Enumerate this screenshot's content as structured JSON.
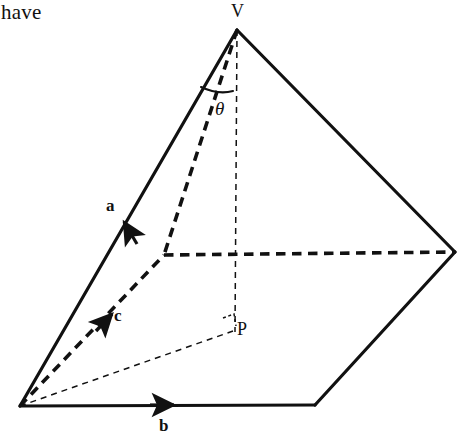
{
  "page": {
    "width": 462,
    "height": 434,
    "background_color": "#ffffff",
    "ink_color": "#111111"
  },
  "body_text": {
    "fragment": "have",
    "x": 2,
    "y": 4
  },
  "figure": {
    "type": "geometric-diagram",
    "stroke_color": "#111111",
    "vertices": [
      {
        "name": "V",
        "role": "apex",
        "x": 237,
        "y": 30
      },
      {
        "name": "A",
        "role": "base-front-left",
        "x": 20,
        "y": 406
      },
      {
        "name": "B",
        "role": "base-front-right",
        "x": 315,
        "y": 405
      },
      {
        "name": "D",
        "role": "base-right",
        "x": 455,
        "y": 252
      },
      {
        "name": "C",
        "role": "base-back-hidden",
        "x": 164,
        "y": 255
      },
      {
        "name": "P",
        "role": "foot-of-perpendicular",
        "x": 235,
        "y": 330
      }
    ],
    "edges": [
      {
        "name": "edge-V-A",
        "style": "solid",
        "width": 3.2,
        "from": [
          237,
          30
        ],
        "to": [
          20,
          406
        ]
      },
      {
        "name": "edge-V-D",
        "style": "solid",
        "width": 3.2,
        "from": [
          237,
          30
        ],
        "to": [
          455,
          252
        ]
      },
      {
        "name": "edge-A-B",
        "style": "solid",
        "width": 3.2,
        "from": [
          20,
          406
        ],
        "to": [
          315,
          405
        ]
      },
      {
        "name": "edge-B-D",
        "style": "solid",
        "width": 3.2,
        "from": [
          315,
          405
        ],
        "to": [
          455,
          252
        ]
      },
      {
        "name": "edge-V-C",
        "style": "dashed-thick",
        "width": 3.6,
        "from": [
          237,
          30
        ],
        "to": [
          164,
          255
        ]
      },
      {
        "name": "edge-A-C",
        "style": "dashed-thick",
        "width": 3.6,
        "from": [
          20,
          406
        ],
        "to": [
          164,
          255
        ]
      },
      {
        "name": "edge-C-D",
        "style": "dashed-thick",
        "width": 3.6,
        "from": [
          164,
          255
        ],
        "to": [
          455,
          252
        ]
      },
      {
        "name": "edge-V-P",
        "style": "dashed-thin",
        "width": 1.4,
        "from": [
          237,
          30
        ],
        "to": [
          235,
          330
        ]
      },
      {
        "name": "edge-A-P",
        "style": "dashed-thin",
        "width": 1.4,
        "from": [
          20,
          406
        ],
        "to": [
          235,
          330
        ]
      }
    ],
    "arrows": [
      {
        "name": "vector-a-arrowhead",
        "on_edge": "edge-V-A",
        "tip": [
          121,
          223
        ],
        "direction": "toward-apex"
      },
      {
        "name": "vector-b-arrowhead",
        "on_edge": "edge-A-B",
        "tip": [
          177,
          405
        ],
        "direction": "toward-right"
      },
      {
        "name": "vector-c-arrowhead",
        "on_edge": "edge-A-C",
        "tip": [
          113,
          306
        ],
        "direction": "toward-back-vertex"
      }
    ],
    "angle_mark": {
      "name": "theta-arc",
      "at_vertex": "V",
      "between": [
        "edge-V-A",
        "edge-V-P"
      ],
      "radius": 62
    },
    "right_angle_mark": {
      "name": "right-angle-at-P",
      "at_vertex": "P",
      "size": 11
    },
    "labels": {
      "apex": {
        "text": "V",
        "x": 231,
        "y": 1
      },
      "point_p": {
        "text": "P",
        "x": 238,
        "y": 320
      },
      "vector_a": {
        "text": "a",
        "x": 106,
        "y": 197
      },
      "vector_b": {
        "text": "b",
        "x": 159,
        "y": 418
      },
      "vector_c": {
        "text": "c",
        "x": 114,
        "y": 308
      },
      "angle_theta": {
        "text": "θ",
        "x": 216,
        "y": 100
      }
    }
  }
}
